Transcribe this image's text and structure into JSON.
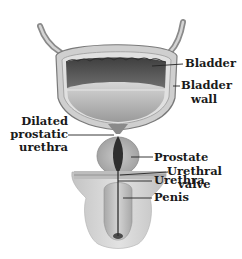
{
  "figure": {
    "type": "anatomical-diagram"
  },
  "labels": {
    "bladder": "Bladder",
    "bladder_wall_line1": "Bladder",
    "bladder_wall_line2": "wall",
    "dilated_line1": "Dilated",
    "dilated_line2": "prostatic",
    "dilated_line3": "urethra",
    "prostate": "Prostate",
    "urethral_valve_line1": "Urethral",
    "urethral_valve_line2": "valve",
    "urethra": "Urethra",
    "penis": "Penis"
  },
  "colors": {
    "background": "#ffffff",
    "text": "#1a1a1a",
    "leader_line": "#222222",
    "tissue_light": "#d9d9d9",
    "tissue_mid": "#b5b5b5",
    "cavity_dark": "#5a5a5a",
    "urethra_dark": "#2e2e2e"
  }
}
